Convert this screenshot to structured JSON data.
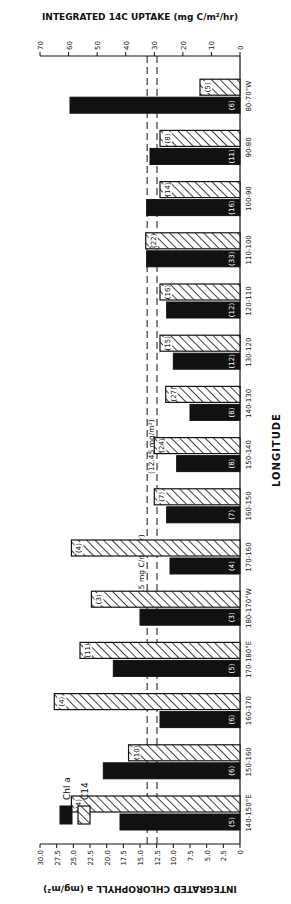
{
  "chart_data": {
    "type": "bar",
    "xlabel": "LONGITUDE",
    "ylabel_left": "INTEGRATED CHLOROPHYLL a (mg/m²)",
    "ylabel_right": "INTEGRATED 14C UPTAKE (mg C/m²/hr)",
    "ylim_left": [
      0,
      30
    ],
    "ylim_right": [
      0,
      70
    ],
    "yticks_left": [
      "0",
      "2.5",
      "5.0",
      "7.5",
      "10.0",
      "12.5",
      "15.0",
      "17.5",
      "20.0",
      "22.5",
      "25.0",
      "27.5",
      "30.0"
    ],
    "yticks_right": [
      "0",
      "10",
      "20",
      "30",
      "40",
      "50",
      "60",
      "70"
    ],
    "categories": [
      "140-150°E",
      "150-160",
      "160-170",
      "170-180°E",
      "180-170°W",
      "170-160",
      "160-150",
      "150-140",
      "140-130",
      "130-120",
      "120-110",
      "110-100",
      "100-90",
      "90-80",
      "80-70°W"
    ],
    "series": [
      {
        "name": "Chl a",
        "axis": "left",
        "values": [
          18.0,
          20.5,
          12.0,
          19.0,
          15.0,
          10.5,
          11.0,
          9.5,
          7.5,
          10.0,
          11.0,
          14.0,
          14.0,
          13.5,
          25.5
        ],
        "counts": [
          "(5)",
          "(6)",
          "(6)",
          "(5)",
          "(3)",
          "(4)",
          "(7)",
          "(8)",
          "(8)",
          "(12)",
          "(12)",
          "(33)",
          "(16)",
          "(11)",
          "(6)"
        ]
      },
      {
        "name": "C14",
        "axis": "right",
        "values": [
          59,
          39,
          65,
          56,
          52,
          59,
          30,
          30,
          26,
          28,
          28,
          33,
          28,
          28,
          14
        ],
        "counts": [
          "(4)",
          "(10)",
          "(4)",
          "(11)",
          "(3)",
          "(4)",
          "(7)",
          "(24)",
          "(27)",
          "(15)",
          "(16)",
          "(22)",
          "(14)",
          "(8)",
          "(5)"
        ]
      }
    ],
    "reference_lines": [
      {
        "label": "(12.45 mg/m²)",
        "axis": "left",
        "value": 12.45,
        "style": "dashed"
      },
      {
        "label": "(32.5 mg C/m2/hr)",
        "axis": "right",
        "value": 32.5,
        "style": "dashed"
      }
    ],
    "legend": [
      {
        "label": "Chl a",
        "pattern": "solid-black"
      },
      {
        "label": "C14",
        "pattern": "hatched"
      }
    ],
    "legend_position": "upper-left",
    "grid": false
  },
  "labels": {
    "xlabel": "LONGITUDE",
    "ylabel_left": "INTEGRATED CHLOROPHYLL a (mg/m²)",
    "ylabel_right": "INTEGRATED 14C UPTAKE (mg C/m²/hr)",
    "legend_chl": "Chl a",
    "legend_c14": "C14",
    "refline_chl": "(12.45 mg/m²)",
    "refline_c14": "(32.5 mg C/m2/hr)"
  }
}
